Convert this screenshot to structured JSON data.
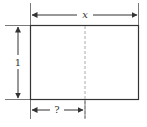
{
  "diagram": {
    "labels": {
      "width": "x",
      "height": "1",
      "unknown": "?"
    },
    "colors": {
      "stroke": "#333333",
      "dashed": "#aaaaaa",
      "background": "#ffffff"
    }
  }
}
